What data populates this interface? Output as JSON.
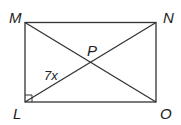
{
  "figure": {
    "shape": "rectangle",
    "vertices": {
      "M": {
        "label": "M"
      },
      "N": {
        "label": "N"
      },
      "L": {
        "label": "L"
      },
      "O": {
        "label": "O"
      },
      "P": {
        "label": "P"
      }
    },
    "segment_label": "7x",
    "right_angle_at": "L",
    "diagonals": [
      "MO",
      "LN"
    ],
    "colors": {
      "stroke": "#333333",
      "background": "#ffffff"
    }
  }
}
